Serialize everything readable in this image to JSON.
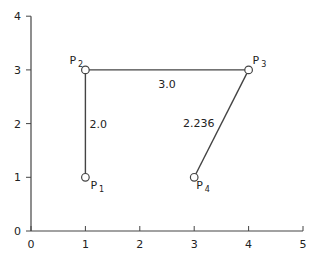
{
  "chart_data": {
    "type": "scatter",
    "title": "",
    "xlabel": "",
    "ylabel": "",
    "xlim": [
      0,
      5
    ],
    "ylim": [
      0,
      4
    ],
    "x_ticks": [
      "0",
      "1",
      "2",
      "3",
      "4",
      "5"
    ],
    "y_ticks": [
      "0",
      "1",
      "2",
      "3",
      "4"
    ],
    "grid": false,
    "points": [
      {
        "name": "P1",
        "base": "P",
        "sub": "1",
        "x": 1,
        "y": 1
      },
      {
        "name": "P2",
        "base": "P",
        "sub": "2",
        "x": 1,
        "y": 3
      },
      {
        "name": "P3",
        "base": "P",
        "sub": "3",
        "x": 4,
        "y": 3
      },
      {
        "name": "P4",
        "base": "P",
        "sub": "4",
        "x": 3,
        "y": 1
      }
    ],
    "edges": [
      {
        "from": "P1",
        "to": "P2",
        "label": "2.0"
      },
      {
        "from": "P2",
        "to": "P3",
        "label": "3.0"
      },
      {
        "from": "P3",
        "to": "P4",
        "label": "2.236"
      }
    ]
  },
  "colors": {
    "line": "#444444",
    "axis": "#444444",
    "point_fill": "#ffffff",
    "text": "#222222"
  }
}
